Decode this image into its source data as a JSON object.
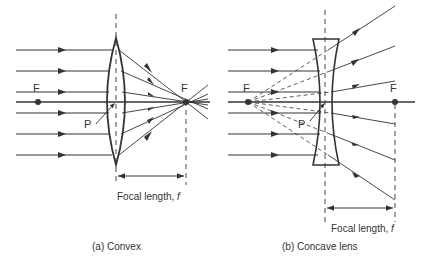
{
  "figure": {
    "convex": {
      "caption": "(a) Convex",
      "focal_label_text": "Focal length, ",
      "focal_label_symbol": "f",
      "focus_left_label": "F",
      "focus_right_label": "F",
      "pole_label": "P"
    },
    "concave": {
      "caption": "(b) Concave lens",
      "focal_label_text": "Focal length, ",
      "focal_label_symbol": "f",
      "focus_left_label": "F",
      "focus_right_label": "F",
      "pole_label": "P"
    },
    "colors": {
      "line": "#333333",
      "background": "#ffffff"
    }
  }
}
